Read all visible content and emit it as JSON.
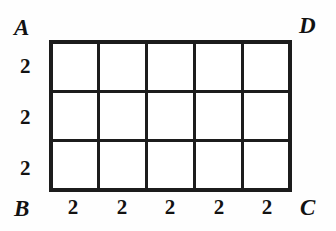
{
  "figure": {
    "type": "geometry-grid-diagram",
    "width": 336,
    "height": 231,
    "background_color": "#fefefe",
    "line_color": "#1c1c1c",
    "text_color": "#121212"
  },
  "grid": {
    "columns": 5,
    "rows": 3,
    "left_px": 49,
    "top_px": 40,
    "width_px": 243,
    "height_px": 152,
    "cell_count": 15,
    "outer_border_px": 4,
    "inner_line_px": 3
  },
  "vertices": [
    {
      "id": "A",
      "label": "A",
      "position": "top-left"
    },
    {
      "id": "D",
      "label": "D",
      "position": "top-right"
    },
    {
      "id": "B",
      "label": "B",
      "position": "bottom-left"
    },
    {
      "id": "C",
      "label": "C",
      "position": "bottom-right"
    }
  ],
  "left_segment_labels": [
    "2",
    "2",
    "2"
  ],
  "bottom_segment_labels": [
    "2",
    "2",
    "2",
    "2",
    "2"
  ],
  "derived": {
    "side_AB": "6",
    "side_BC": "10"
  }
}
